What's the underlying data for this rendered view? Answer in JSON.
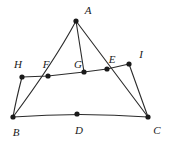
{
  "figure": {
    "type": "geometry-diagram",
    "width": 172,
    "height": 142,
    "background_color": "#ffffff",
    "stroke_color": "#2b2b2b",
    "point_color": "#1a1a1a",
    "label_color": "#1a1a1a",
    "stroke_width": 1.1,
    "point_radius": 2.6
  },
  "points": [
    {
      "id": "A",
      "label": "A",
      "x": 76,
      "y": 21,
      "label_x": 88,
      "label_y": 10
    },
    {
      "id": "H",
      "label": "H",
      "x": 22,
      "y": 77,
      "label_x": 18,
      "label_y": 64
    },
    {
      "id": "F",
      "label": "F",
      "x": 48,
      "y": 76,
      "label_x": 46,
      "label_y": 64
    },
    {
      "id": "G",
      "label": "G",
      "x": 84,
      "y": 72,
      "label_x": 78,
      "label_y": 64
    },
    {
      "id": "E",
      "label": "E",
      "x": 107,
      "y": 69,
      "label_x": 112,
      "label_y": 59
    },
    {
      "id": "I",
      "label": "I",
      "x": 129,
      "y": 64,
      "label_x": 141,
      "label_y": 54
    },
    {
      "id": "B",
      "label": "B",
      "x": 13,
      "y": 117,
      "label_x": 16,
      "label_y": 132
    },
    {
      "id": "D",
      "label": "D",
      "x": 77,
      "y": 114,
      "label_x": 79,
      "label_y": 130
    },
    {
      "id": "C",
      "label": "C",
      "x": 148,
      "y": 117,
      "label_x": 157,
      "label_y": 130
    }
  ],
  "segments": [
    {
      "id": "AB",
      "name": "segment-a-b",
      "from": "A",
      "to": "B",
      "path": "M 76 21 Q 54 62 13 117"
    },
    {
      "id": "AG",
      "name": "segment-a-g",
      "from": "A",
      "to": "G",
      "path": "M 76 21 L 84 72"
    },
    {
      "id": "AC",
      "name": "segment-a-c",
      "from": "A",
      "to": "C",
      "path": "M 76 21 L 148 117"
    },
    {
      "id": "HI",
      "name": "segment-h-i",
      "from": "H",
      "to": "I",
      "path": "M 22 77 L 48 76 L 84 72 L 107 69 L 129 64"
    },
    {
      "id": "HB",
      "name": "segment-h-b",
      "from": "H",
      "to": "B",
      "path": "M 22 77 Q 16 100 13 117"
    },
    {
      "id": "IC",
      "name": "segment-i-c",
      "from": "I",
      "to": "C",
      "path": "M 129 64 L 148 117"
    },
    {
      "id": "BC",
      "name": "segment-b-c",
      "from": "B",
      "to": "C",
      "path": "M 13 117 Q 80 112 148 117"
    }
  ]
}
